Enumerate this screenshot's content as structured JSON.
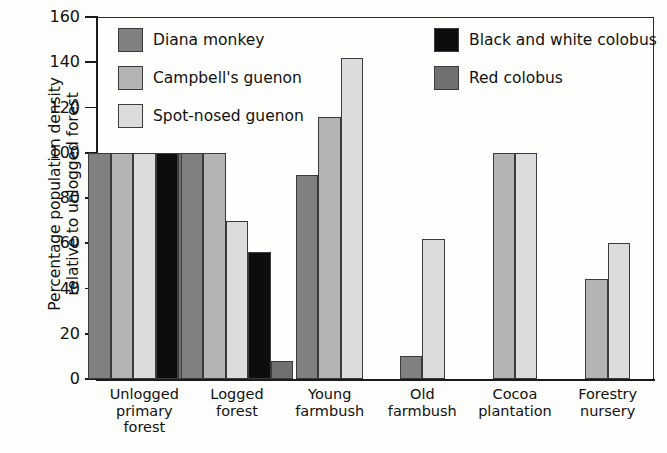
{
  "chart_data": {
    "type": "bar",
    "title": "",
    "xlabel": "",
    "ylabel": "Percentage population density\nrelative to unlogged forest",
    "ylim": [
      0,
      160
    ],
    "yticks": [
      0,
      20,
      40,
      60,
      80,
      100,
      120,
      140,
      160
    ],
    "ytick_labels": [
      "0",
      "20",
      "40",
      "60",
      "80",
      "100",
      "120",
      "140",
      "160"
    ],
    "grid": false,
    "legend_position": "inside-top-left-and-top-right",
    "categories": [
      "Unlogged\nprimary\nforest",
      "Logged\nforest",
      "Young\nfarmbush",
      "Old\nfarmbush",
      "Cocoa\nplantation",
      "Forestry\nnursery"
    ],
    "series": [
      {
        "name": "Diana monkey",
        "color": "#808080",
        "values": [
          100,
          100,
          90,
          10,
          null,
          null
        ]
      },
      {
        "name": "Campbell's guenon",
        "color": "#b3b3b3",
        "values": [
          100,
          100,
          116,
          null,
          100,
          44
        ]
      },
      {
        "name": "Spot-nosed guenon",
        "color": "#dcdcdc",
        "values": [
          100,
          70,
          142,
          62,
          100,
          60
        ]
      },
      {
        "name": "Black and white colobus",
        "color": "#0d0d0d",
        "values": [
          100,
          56,
          null,
          null,
          null,
          null
        ]
      },
      {
        "name": "Red colobus",
        "color": "#707070",
        "values": [
          100,
          8,
          null,
          null,
          null,
          null
        ]
      }
    ]
  },
  "legend": {
    "items": [
      {
        "label": "Diana monkey",
        "color": "#808080"
      },
      {
        "label": "Campbell's guenon",
        "color": "#b3b3b3"
      },
      {
        "label": "Spot-nosed guenon",
        "color": "#dcdcdc"
      },
      {
        "label": "Black and white colobus",
        "color": "#0d0d0d"
      },
      {
        "label": "Red colobus",
        "color": "#707070"
      }
    ]
  }
}
